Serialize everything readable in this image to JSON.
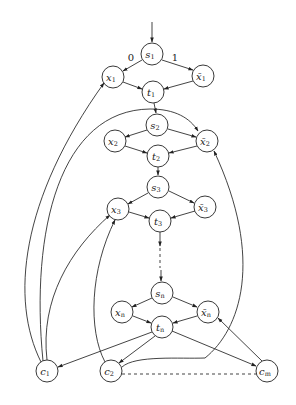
{
  "diagram": {
    "type": "directed-graph",
    "edge_labels": {
      "s1_x1": "0",
      "s1_xbar1": "1"
    },
    "nodes": [
      {
        "id": "s1",
        "base": "s",
        "sub": "1",
        "bar": false,
        "x": 152,
        "y": 54
      },
      {
        "id": "x1",
        "base": "x",
        "sub": "1",
        "bar": false,
        "x": 113,
        "y": 77
      },
      {
        "id": "xb1",
        "base": "x",
        "sub": "1",
        "bar": true,
        "x": 203,
        "y": 76
      },
      {
        "id": "t1",
        "base": "t",
        "sub": "1",
        "bar": false,
        "x": 153,
        "y": 92
      },
      {
        "id": "s2",
        "base": "s",
        "sub": "2",
        "bar": false,
        "x": 157,
        "y": 125
      },
      {
        "id": "x2",
        "base": "x",
        "sub": "2",
        "bar": false,
        "x": 115,
        "y": 141
      },
      {
        "id": "xb2",
        "base": "x",
        "sub": "2",
        "bar": true,
        "x": 207,
        "y": 141
      },
      {
        "id": "t2",
        "base": "t",
        "sub": "2",
        "bar": false,
        "x": 158,
        "y": 156
      },
      {
        "id": "s3",
        "base": "s",
        "sub": "3",
        "bar": false,
        "x": 158,
        "y": 187
      },
      {
        "id": "x3",
        "base": "x",
        "sub": "3",
        "bar": false,
        "x": 118,
        "y": 209
      },
      {
        "id": "xb3",
        "base": "x",
        "sub": "3",
        "bar": true,
        "x": 205,
        "y": 207
      },
      {
        "id": "t3",
        "base": "t",
        "sub": "3",
        "bar": false,
        "x": 160,
        "y": 221
      },
      {
        "id": "sn",
        "base": "s",
        "sub": "n",
        "bar": false,
        "x": 162,
        "y": 293
      },
      {
        "id": "xn",
        "base": "x",
        "sub": "n",
        "bar": false,
        "x": 122,
        "y": 312
      },
      {
        "id": "xbn",
        "base": "x",
        "sub": "n",
        "bar": true,
        "x": 208,
        "y": 312
      },
      {
        "id": "tn",
        "base": "t",
        "sub": "n",
        "bar": false,
        "x": 162,
        "y": 327
      },
      {
        "id": "c1",
        "base": "c",
        "sub": "1",
        "bar": false,
        "x": 47,
        "y": 371
      },
      {
        "id": "c2",
        "base": "c",
        "sub": "2",
        "bar": false,
        "x": 111,
        "y": 371
      },
      {
        "id": "cm",
        "base": "c",
        "sub": "m",
        "bar": false,
        "x": 267,
        "y": 371
      }
    ],
    "edges": [
      [
        "start",
        "s1"
      ],
      [
        "s1",
        "x1"
      ],
      [
        "s1",
        "xb1"
      ],
      [
        "x1",
        "t1"
      ],
      [
        "xb1",
        "t1"
      ],
      [
        "t1",
        "s2"
      ],
      [
        "s2",
        "x2"
      ],
      [
        "s2",
        "xb2"
      ],
      [
        "x2",
        "t2"
      ],
      [
        "xb2",
        "t2"
      ],
      [
        "t2",
        "s3"
      ],
      [
        "s3",
        "x3"
      ],
      [
        "s3",
        "xb3"
      ],
      [
        "x3",
        "t3"
      ],
      [
        "xb3",
        "t3"
      ],
      [
        "t3",
        "sn",
        "dashed"
      ],
      [
        "sn",
        "xn"
      ],
      [
        "sn",
        "xbn"
      ],
      [
        "xn",
        "tn"
      ],
      [
        "xbn",
        "tn"
      ],
      [
        "tn",
        "c1"
      ],
      [
        "tn",
        "c2"
      ],
      [
        "tn",
        "cm"
      ],
      [
        "c1",
        "x1"
      ],
      [
        "c1",
        "xb2"
      ],
      [
        "c1",
        "x3"
      ],
      [
        "c2",
        "x3"
      ],
      [
        "c2",
        "xb2"
      ],
      [
        "cm",
        "xbn"
      ],
      [
        "c2",
        "cm",
        "dashed-undirected"
      ]
    ]
  },
  "labels": {
    "s1": "s",
    "s1_sub": "1",
    "x1": "x",
    "x1_sub": "1",
    "xb1": "x̄",
    "xb1_sub": "1",
    "t1": "t",
    "t1_sub": "1",
    "s2": "s",
    "s2_sub": "2",
    "x2": "x",
    "x2_sub": "2",
    "xb2": "x̄",
    "xb2_sub": "2",
    "t2": "t",
    "t2_sub": "2",
    "s3": "s",
    "s3_sub": "3",
    "x3": "x",
    "x3_sub": "3",
    "xb3": "x̄",
    "xb3_sub": "3",
    "t3": "t",
    "t3_sub": "3",
    "sn": "s",
    "sn_sub": "n",
    "xn": "x",
    "xn_sub": "n",
    "xbn": "x̄",
    "xbn_sub": "n",
    "tn": "t",
    "tn_sub": "n",
    "c1": "c",
    "c1_sub": "1",
    "c2": "c",
    "c2_sub": "2",
    "cm": "c",
    "cm_sub": "m",
    "edge0": "0",
    "edge1": "1"
  }
}
